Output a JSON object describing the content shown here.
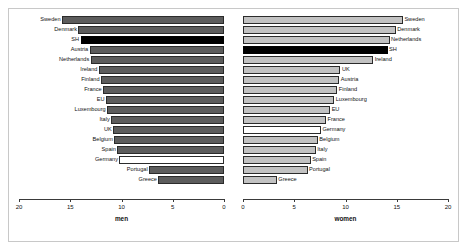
{
  "chart_data": {
    "type": "bar",
    "title": "",
    "subtitle": "",
    "orientation": "horizontal",
    "layout": "back-to-back population pyramid, two panels",
    "panels": [
      {
        "name": "men",
        "xlabel": "men",
        "ylabel": "",
        "xlim": [
          20,
          0
        ],
        "axis_reversed": true,
        "tick_values": [
          20,
          15,
          10,
          5,
          0
        ],
        "tick_labels": [
          "20",
          "15",
          "10",
          "5",
          "0"
        ],
        "grid": false,
        "bar_fill": "#5c5c5c",
        "categories": [
          "Sweden",
          "Denmark",
          "SH",
          "Austria",
          "Netherlands",
          "Ireland",
          "Finland",
          "France",
          "EU",
          "Luxembourg",
          "Italy",
          "UK",
          "Belgium",
          "Spain",
          "Germany",
          "Portugal",
          "Greece"
        ],
        "values": [
          15.8,
          14.2,
          14.0,
          13.1,
          13.0,
          12.2,
          12.0,
          11.8,
          11.5,
          11.4,
          11.0,
          10.8,
          10.7,
          10.4,
          10.2,
          7.3,
          6.4
        ],
        "highlight": {
          "SH": "#000000",
          "Germany": "#ffffff"
        }
      },
      {
        "name": "women",
        "xlabel": "women",
        "ylabel": "",
        "xlim": [
          0,
          20
        ],
        "axis_reversed": false,
        "tick_values": [
          0,
          5,
          10,
          15,
          20
        ],
        "tick_labels": [
          "0",
          "5",
          "10",
          "15",
          "20"
        ],
        "grid": false,
        "bar_fill": "#c2c2c2",
        "categories": [
          "Sweden",
          "Denmark",
          "Netherlands",
          "SH",
          "Ireland",
          "UK",
          "Austria",
          "Finland",
          "Luxembourg",
          "EU",
          "France",
          "Germany",
          "Belgium",
          "Italy",
          "Spain",
          "Portugal",
          "Greece"
        ],
        "values": [
          15.6,
          14.9,
          14.3,
          14.1,
          12.7,
          9.5,
          9.4,
          9.2,
          8.9,
          8.5,
          8.1,
          7.6,
          7.3,
          7.1,
          6.6,
          6.3,
          3.3
        ],
        "highlight": {
          "SH": "#000000",
          "Germany": "#ffffff"
        }
      }
    ],
    "colors": {
      "men_bar": "#5c5c5c",
      "women_bar": "#c2c2c2",
      "highlight_bar": "#000000",
      "empty_bar": "#ffffff",
      "bar_border": "#2b2b2b",
      "axis": "#3a3a3a",
      "frame": "#c8c8c8",
      "background": "#ffffff"
    }
  }
}
